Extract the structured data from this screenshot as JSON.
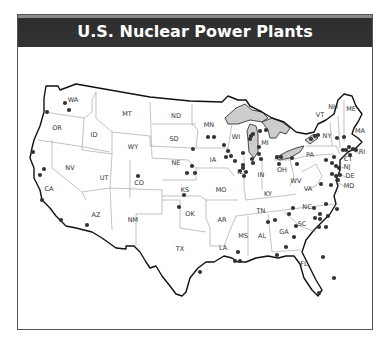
{
  "title": "U.S. Nuclear Power Plants",
  "colors": {
    "title_bg": "#333333",
    "title_text": "#ffffff",
    "dot": "#333333",
    "lakes": "#cccccc",
    "border": "#111111",
    "state_lines": "#999999"
  },
  "states": [
    {
      "abbr": "WA",
      "x": 73,
      "y": 102
    },
    {
      "abbr": "OR",
      "x": 57,
      "y": 130
    },
    {
      "abbr": "CA",
      "x": 49,
      "y": 191
    },
    {
      "abbr": "NV",
      "x": 70,
      "y": 170
    },
    {
      "abbr": "ID",
      "x": 94,
      "y": 137
    },
    {
      "abbr": "MT",
      "x": 127,
      "y": 116
    },
    {
      "abbr": "WY",
      "x": 133,
      "y": 149
    },
    {
      "abbr": "UT",
      "x": 104,
      "y": 180
    },
    {
      "abbr": "CO",
      "x": 139,
      "y": 185
    },
    {
      "abbr": "AZ",
      "x": 96,
      "y": 217
    },
    {
      "abbr": "NM",
      "x": 133,
      "y": 222
    },
    {
      "abbr": "ND",
      "x": 176,
      "y": 118
    },
    {
      "abbr": "SD",
      "x": 174,
      "y": 141
    },
    {
      "abbr": "NE",
      "x": 176,
      "y": 165
    },
    {
      "abbr": "KS",
      "x": 185,
      "y": 192
    },
    {
      "abbr": "OK",
      "x": 190,
      "y": 216
    },
    {
      "abbr": "TX",
      "x": 180,
      "y": 251
    },
    {
      "abbr": "MN",
      "x": 209,
      "y": 127
    },
    {
      "abbr": "IA",
      "x": 213,
      "y": 162
    },
    {
      "abbr": "MO",
      "x": 221,
      "y": 192
    },
    {
      "abbr": "AR",
      "x": 222,
      "y": 222
    },
    {
      "abbr": "LA",
      "x": 223,
      "y": 250
    },
    {
      "abbr": "WI",
      "x": 236,
      "y": 139
    },
    {
      "abbr": "IL",
      "x": 240,
      "y": 174
    },
    {
      "abbr": "MS",
      "x": 243,
      "y": 238
    },
    {
      "abbr": "MI",
      "x": 265,
      "y": 145
    },
    {
      "abbr": "IN",
      "x": 261,
      "y": 177
    },
    {
      "abbr": "KY",
      "x": 268,
      "y": 196
    },
    {
      "abbr": "TN",
      "x": 261,
      "y": 213
    },
    {
      "abbr": "AL",
      "x": 262,
      "y": 238
    },
    {
      "abbr": "GA",
      "x": 284,
      "y": 234
    },
    {
      "abbr": "FL",
      "x": 304,
      "y": 266
    },
    {
      "abbr": "OH",
      "x": 282,
      "y": 172
    },
    {
      "abbr": "WV",
      "x": 296,
      "y": 183
    },
    {
      "abbr": "VA",
      "x": 308,
      "y": 191
    },
    {
      "abbr": "NC",
      "x": 307,
      "y": 209
    },
    {
      "abbr": "SC",
      "x": 302,
      "y": 226
    },
    {
      "abbr": "PA",
      "x": 310,
      "y": 157
    },
    {
      "abbr": "NY",
      "x": 327,
      "y": 138
    },
    {
      "abbr": "VT",
      "x": 320,
      "y": 117
    },
    {
      "abbr": "NH",
      "x": 333,
      "y": 109
    },
    {
      "abbr": "ME",
      "x": 351,
      "y": 111
    },
    {
      "abbr": "MA",
      "x": 360,
      "y": 133
    },
    {
      "abbr": "RI",
      "x": 362,
      "y": 154
    },
    {
      "abbr": "CT",
      "x": 348,
      "y": 161
    },
    {
      "abbr": "NJ",
      "x": 347,
      "y": 169
    },
    {
      "abbr": "DE",
      "x": 350,
      "y": 178
    },
    {
      "abbr": "MD",
      "x": 349,
      "y": 188
    }
  ],
  "plants": [
    [
      65,
      103
    ],
    [
      69,
      110
    ],
    [
      47,
      112
    ],
    [
      33,
      152
    ],
    [
      44,
      169
    ],
    [
      40,
      175
    ],
    [
      42,
      200
    ],
    [
      61,
      220
    ],
    [
      87,
      225
    ],
    [
      138,
      176
    ],
    [
      184,
      195
    ],
    [
      179,
      207
    ],
    [
      193,
      149
    ],
    [
      192,
      166
    ],
    [
      187,
      173
    ],
    [
      195,
      173
    ],
    [
      208,
      137
    ],
    [
      214,
      137
    ],
    [
      224,
      145
    ],
    [
      228,
      151
    ],
    [
      226,
      157
    ],
    [
      231,
      156
    ],
    [
      235,
      161
    ],
    [
      243,
      153
    ],
    [
      243,
      165
    ],
    [
      240,
      171
    ],
    [
      243,
      168
    ],
    [
      246,
      172
    ],
    [
      244,
      176
    ],
    [
      252,
      159
    ],
    [
      253,
      163
    ],
    [
      250,
      139
    ],
    [
      251,
      136
    ],
    [
      253,
      134
    ],
    [
      260,
      131
    ],
    [
      266,
      130
    ],
    [
      259,
      147
    ],
    [
      259,
      154
    ],
    [
      261,
      159
    ],
    [
      277,
      157
    ],
    [
      281,
      157
    ],
    [
      279,
      164
    ],
    [
      292,
      158
    ],
    [
      297,
      164
    ],
    [
      311,
      139
    ],
    [
      315,
      136
    ],
    [
      318,
      135
    ],
    [
      337,
      138
    ],
    [
      344,
      137
    ],
    [
      349,
      147
    ],
    [
      343,
      150
    ],
    [
      346,
      150
    ],
    [
      353,
      149
    ],
    [
      356,
      150
    ],
    [
      350,
      155
    ],
    [
      334,
      157
    ],
    [
      326,
      160
    ],
    [
      332,
      163
    ],
    [
      336,
      166
    ],
    [
      339,
      168
    ],
    [
      332,
      174
    ],
    [
      336,
      176
    ],
    [
      340,
      175
    ],
    [
      338,
      180
    ],
    [
      331,
      185
    ],
    [
      321,
      184
    ],
    [
      314,
      208
    ],
    [
      326,
      204
    ],
    [
      320,
      214
    ],
    [
      320,
      219
    ],
    [
      328,
      216
    ],
    [
      337,
      209
    ],
    [
      319,
      227
    ],
    [
      326,
      227
    ],
    [
      315,
      218
    ],
    [
      293,
      208
    ],
    [
      289,
      214
    ],
    [
      275,
      220
    ],
    [
      268,
      222
    ],
    [
      296,
      226
    ],
    [
      294,
      237
    ],
    [
      286,
      247
    ],
    [
      277,
      255
    ],
    [
      238,
      252
    ],
    [
      235,
      261
    ],
    [
      240,
      261
    ],
    [
      323,
      257
    ],
    [
      334,
      278
    ],
    [
      319,
      293
    ],
    [
      200,
      272
    ]
  ]
}
